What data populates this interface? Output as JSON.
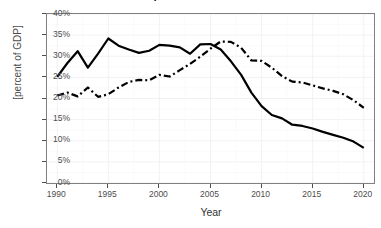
{
  "chart_data": {
    "type": "line",
    "title": "Bilateral trade as percent of Northern and Southern GDP",
    "xlabel": "Year",
    "ylabel": "[percent of GDP]",
    "xlim": [
      1989,
      2021
    ],
    "ylim": [
      0,
      40
    ],
    "yticks": [
      0,
      5,
      10,
      15,
      20,
      25,
      30,
      35,
      40
    ],
    "ytick_labels": [
      "0%",
      "5%",
      "10%",
      "15%",
      "20%",
      "25%",
      "30%",
      "35%",
      "40%"
    ],
    "xticks": [
      1990,
      1995,
      2000,
      2005,
      2010,
      2015,
      2020
    ],
    "xtick_labels": [
      "1990",
      "1995",
      "2000",
      "2005",
      "2010",
      "2015",
      "2020"
    ],
    "grid": true,
    "legend": "none",
    "x": [
      1990,
      1991,
      1992,
      1993,
      1994,
      1995,
      1996,
      1997,
      1998,
      1999,
      2000,
      2001,
      2002,
      2003,
      2004,
      2005,
      2006,
      2007,
      2008,
      2009,
      2010,
      2011,
      2012,
      2013,
      2014,
      2015,
      2016,
      2017,
      2018,
      2019,
      2020
    ],
    "series": [
      {
        "name": "Northern GDP",
        "linestyle": "solid",
        "color": "#000000",
        "values": [
          25.1,
          28.4,
          31.2,
          27.3,
          30.6,
          34.2,
          32.5,
          31.6,
          30.8,
          31.3,
          32.7,
          32.5,
          32.1,
          30.6,
          32.8,
          32.9,
          31.6,
          28.8,
          25.6,
          21.4,
          18.2,
          16.1,
          15.3,
          13.8,
          13.5,
          12.9,
          12.1,
          11.4,
          10.7,
          9.8,
          8.3
        ]
      },
      {
        "name": "Southern GDP",
        "linestyle": "dashdot",
        "color": "#000000",
        "values": [
          20.7,
          21.4,
          20.5,
          22.6,
          20.4,
          21.0,
          22.6,
          23.9,
          24.4,
          24.3,
          25.6,
          25.2,
          26.7,
          28.2,
          29.9,
          31.8,
          33.5,
          33.4,
          32.0,
          29.0,
          28.9,
          27.3,
          25.3,
          24.0,
          23.8,
          23.1,
          22.4,
          21.8,
          21.0,
          19.6,
          17.8
        ]
      }
    ]
  }
}
